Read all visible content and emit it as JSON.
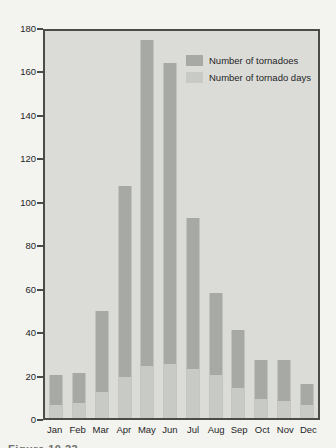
{
  "figure": {
    "cropped_caption": "Figure 10.23"
  },
  "colors": {
    "page_background": "#f3f3f0",
    "plot_background": "#dbdcd8",
    "axis_border": "#4b4b49",
    "text": "#1f1f1f",
    "tornadoes_bar": "#a7a9a4",
    "tornado_days_bar": "#c8cac5"
  },
  "chart_data": {
    "type": "bar",
    "title": "",
    "xlabel": "",
    "ylabel": "",
    "categories": [
      "Jan",
      "Feb",
      "Mar",
      "Apr",
      "May",
      "Jun",
      "Jul",
      "Aug",
      "Sep",
      "Oct",
      "Nov",
      "Dec"
    ],
    "series": [
      {
        "name": "Number of tornadoes",
        "color": "#a7a9a4",
        "values": [
          20,
          21,
          50,
          108,
          176,
          165,
          93,
          58,
          41,
          27,
          27,
          16
        ]
      },
      {
        "name": "Number of tornado days",
        "color": "#c8cac5",
        "values": [
          6,
          7,
          12,
          19,
          24,
          25,
          23,
          20,
          14,
          9,
          8,
          6
        ]
      }
    ],
    "ylim": [
      0,
      180
    ],
    "yticks": [
      0,
      20,
      40,
      60,
      80,
      100,
      120,
      140,
      160,
      180
    ],
    "grid": false,
    "legend_position": "top-right-inside",
    "bar_style": "overlaid: tornado-days bars drawn in front of tornadoes bars at same x"
  }
}
